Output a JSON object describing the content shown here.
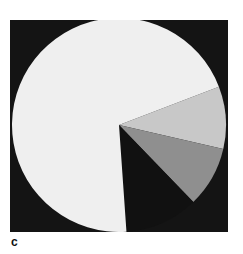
{
  "chart_data": {
    "type": "pie",
    "title": "",
    "panel_label": "c",
    "start_angle_deg": 69,
    "direction": "clockwise",
    "note": "Unlabeled pie; slice shares estimated from pixel geometry.",
    "slices": [
      {
        "name": "slice-light-grey",
        "value": 9.4,
        "angle_deg": 34,
        "color": "#c8c8c8"
      },
      {
        "name": "slice-mid-grey",
        "value": 9.2,
        "angle_deg": 33,
        "color": "#8f8f8f"
      },
      {
        "name": "slice-black",
        "value": 11.1,
        "angle_deg": 40,
        "color": "#111111"
      },
      {
        "name": "slice-white",
        "value": 70.3,
        "angle_deg": 253,
        "color": "#efefef"
      }
    ],
    "background_color": "#141414",
    "legend": null,
    "xlabel": "",
    "ylabel": ""
  },
  "figure": {
    "panel_label": "c"
  }
}
